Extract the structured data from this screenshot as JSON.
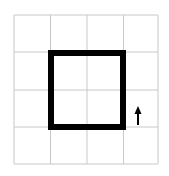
{
  "diagram": {
    "type": "grid-with-square-and-arrow",
    "grid": {
      "rows": 4,
      "cols": 4,
      "line_color": "#c8c8c8"
    },
    "square": {
      "from_cell": [
        1,
        1
      ],
      "to_cell": [
        3,
        3
      ],
      "stroke_color": "#000000",
      "stroke_width": 6
    },
    "arrow": {
      "direction": "up",
      "color": "#000000",
      "position": "right of square, bottom-right grid cell row 3"
    }
  }
}
